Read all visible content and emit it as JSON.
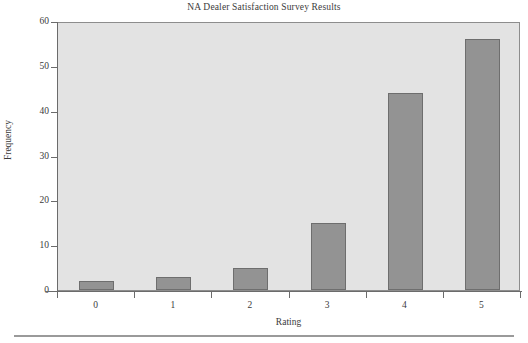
{
  "chart_data": {
    "type": "bar",
    "title": "NA Dealer Satisfaction Survey Results",
    "xlabel": "Rating",
    "ylabel": "Frequency",
    "categories": [
      "0",
      "1",
      "2",
      "3",
      "4",
      "5"
    ],
    "values": [
      2,
      3,
      5,
      15,
      44,
      56
    ],
    "ylim": [
      0,
      60
    ],
    "yticks": [
      0,
      10,
      20,
      30,
      40,
      50,
      60
    ],
    "ytick_labels": [
      "0",
      "10",
      "20",
      "30",
      "40",
      "50",
      "60"
    ],
    "grid": false,
    "legend": null,
    "colors": {
      "bar_fill": "#939393",
      "bar_border": "#6e6e6e",
      "plot_background": "#e3e3e3",
      "plot_border": "#8d8d8d",
      "axis": "#6b6b6b",
      "text": "#3b3b3b",
      "page_background": "#ffffff"
    }
  }
}
